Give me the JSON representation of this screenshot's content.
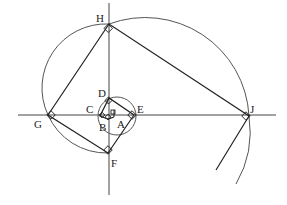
{
  "diagram": {
    "type": "geometric construction (golden/square spiral)",
    "labels": {
      "A": "A",
      "B": "B",
      "C": "C",
      "D": "D",
      "E": "E",
      "F": "F",
      "G": "G",
      "H": "H",
      "J": "J"
    },
    "points": {
      "A": [
        114,
        117
      ],
      "B": [
        108,
        119
      ],
      "C": [
        100,
        116
      ],
      "D": [
        109,
        98
      ],
      "E": [
        134,
        115
      ],
      "F": [
        108,
        153
      ],
      "G": [
        48,
        115
      ],
      "H": [
        109,
        24
      ],
      "J": [
        249,
        116
      ]
    },
    "colors": {
      "line": "#222222",
      "arc": "#555555",
      "background": "#ffffff"
    }
  }
}
